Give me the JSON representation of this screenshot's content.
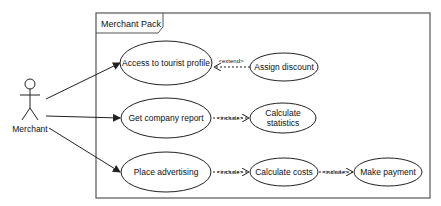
{
  "diagram": {
    "type": "uml-use-case",
    "system_boundary": {
      "label": "Merchant Pack"
    },
    "actor": {
      "label": "Merchant"
    },
    "use_cases": [
      {
        "id": "uc1",
        "label": "Access to tourist profile"
      },
      {
        "id": "uc2",
        "label": "Assign discount"
      },
      {
        "id": "uc3",
        "label": "Get company report"
      },
      {
        "id": "uc4_line1",
        "label": "Calculate"
      },
      {
        "id": "uc4_line2",
        "label": "statistics"
      },
      {
        "id": "uc5",
        "label": "Place advertising"
      },
      {
        "id": "uc6",
        "label": "Calculate costs"
      },
      {
        "id": "uc7",
        "label": "Make payment"
      }
    ],
    "relations": [
      {
        "from": "Merchant",
        "to": "Access to tourist profile",
        "type": "association"
      },
      {
        "from": "Merchant",
        "to": "Get company report",
        "type": "association"
      },
      {
        "from": "Merchant",
        "to": "Place advertising",
        "type": "association"
      },
      {
        "from": "Assign discount",
        "to": "Access to tourist profile",
        "type": "extend",
        "label": "<extend>"
      },
      {
        "from": "Get company report",
        "to": "Calculate statistics",
        "type": "include",
        "label": "<include>"
      },
      {
        "from": "Place advertising",
        "to": "Calculate costs",
        "type": "include",
        "label": "<include>"
      },
      {
        "from": "Calculate costs",
        "to": "Make payment",
        "type": "include",
        "label": "<include>"
      }
    ],
    "stereotype_labels": {
      "extend": "<extend>",
      "include1": "<include>",
      "include2": "<include>",
      "include3": "<include>"
    },
    "colors": {
      "stroke": "#222222",
      "frame": "#555555",
      "background": "#ffffff"
    }
  }
}
